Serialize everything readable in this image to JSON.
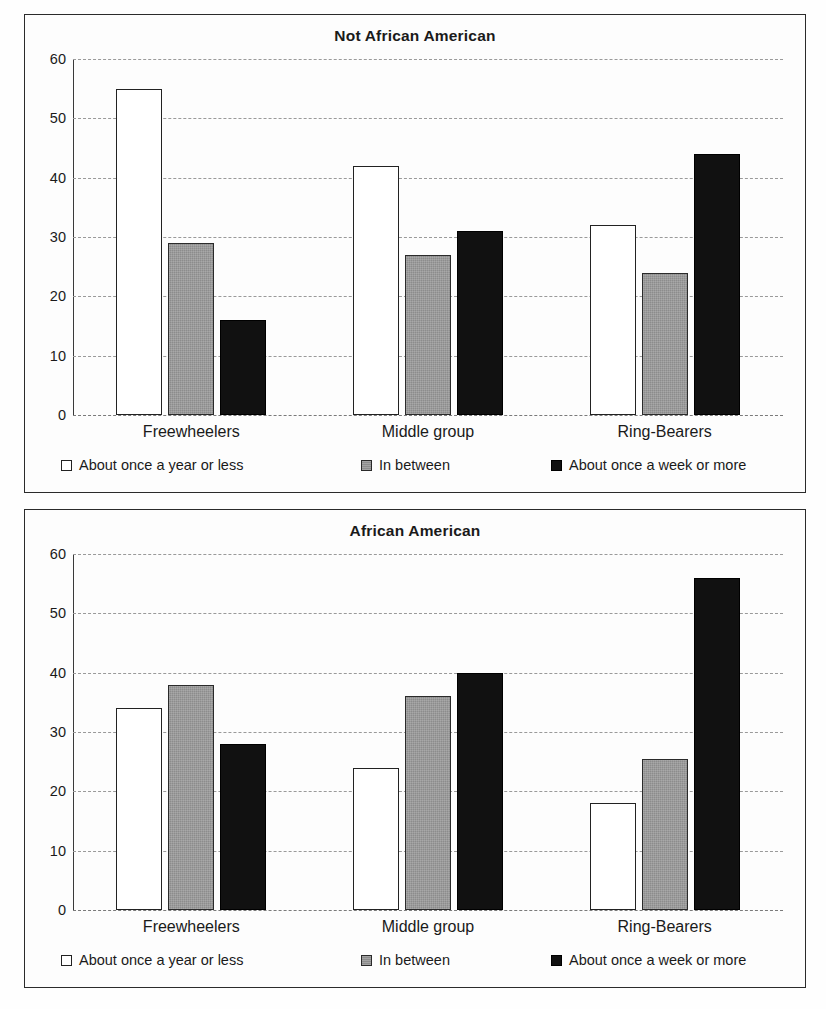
{
  "chart_data": [
    {
      "type": "bar",
      "title": "Not African American",
      "xlabel": "",
      "ylabel": "",
      "ylim": [
        0,
        60
      ],
      "yticks": [
        0,
        10,
        20,
        30,
        40,
        50,
        60
      ],
      "grid": true,
      "legend_position": "bottom",
      "categories": [
        "Freewheelers",
        "Middle group",
        "Ring-Bearers"
      ],
      "series": [
        {
          "name": "About once a year or less",
          "color": "#ffffff",
          "values": [
            55,
            42,
            32
          ]
        },
        {
          "name": "In between",
          "color": "#8c8c8c",
          "values": [
            29,
            27,
            24
          ]
        },
        {
          "name": "About once a week or more",
          "color": "#111111",
          "values": [
            16,
            31,
            44
          ]
        }
      ]
    },
    {
      "type": "bar",
      "title": "African American",
      "xlabel": "",
      "ylabel": "",
      "ylim": [
        0,
        60
      ],
      "yticks": [
        0,
        10,
        20,
        30,
        40,
        50,
        60
      ],
      "grid": true,
      "legend_position": "bottom",
      "categories": [
        "Freewheelers",
        "Middle group",
        "Ring-Bearers"
      ],
      "series": [
        {
          "name": "About once a year or less",
          "color": "#ffffff",
          "values": [
            34,
            24,
            18
          ]
        },
        {
          "name": "In between",
          "color": "#8c8c8c",
          "values": [
            38,
            36,
            25.5
          ]
        },
        {
          "name": "About once a week or more",
          "color": "#111111",
          "values": [
            28,
            40,
            56
          ]
        }
      ]
    }
  ],
  "panels": [
    {
      "title": "Not African American",
      "yticks": [
        "60",
        "50",
        "40",
        "30",
        "20",
        "10",
        "0"
      ],
      "categories": [
        "Freewheelers",
        "Middle group",
        "Ring-Bearers"
      ],
      "legend": [
        "About once a year or less",
        "In between",
        "About once a week or more"
      ]
    },
    {
      "title": "African American",
      "yticks": [
        "60",
        "50",
        "40",
        "30",
        "20",
        "10",
        "0"
      ],
      "categories": [
        "Freewheelers",
        "Middle group",
        "Ring-Bearers"
      ],
      "legend": [
        "About once a year or less",
        "In between",
        "About once a week or more"
      ]
    }
  ]
}
